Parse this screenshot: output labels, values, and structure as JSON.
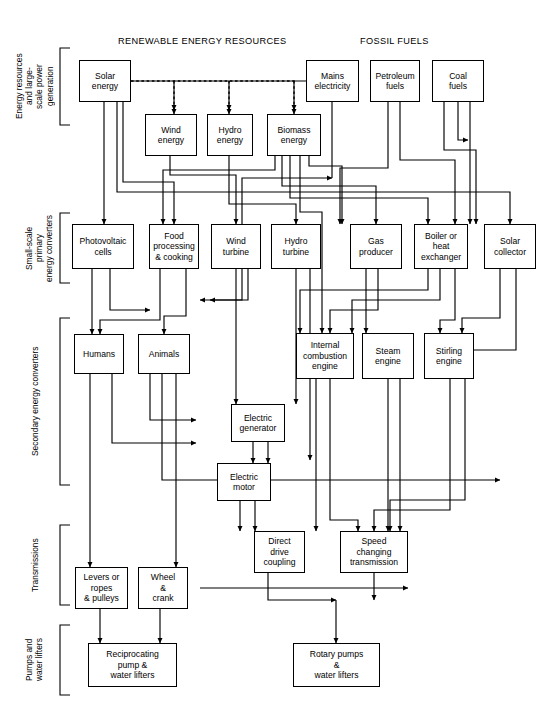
{
  "diagram": {
    "width": 555,
    "height": 725,
    "line_color": "#000000",
    "box_fill": "#ffffff"
  },
  "headers": [
    {
      "id": "renewable",
      "label": "RENEWABLE ENERGY RESOURCES",
      "x": 118,
      "y": 36
    },
    {
      "id": "fossil",
      "label": "FOSSIL FUELS",
      "x": 360,
      "y": 36
    }
  ],
  "groups": [
    {
      "id": "resources",
      "label": "Energy resources and large-\nscale power generation",
      "x": 14,
      "y": 48,
      "h": 77,
      "bx": 60
    },
    {
      "id": "small-scale",
      "label": "Small-scale primary\nenergy converters",
      "x": 24,
      "y": 213,
      "h": 70,
      "bx": 60
    },
    {
      "id": "secondary",
      "label": "Secondary energy converters",
      "x": 30,
      "y": 318,
      "h": 167,
      "bx": 60
    },
    {
      "id": "transmissions",
      "label": "Transmissions",
      "x": 30,
      "y": 525,
      "h": 80,
      "bx": 60
    },
    {
      "id": "pumps",
      "label": "Pumps and\nwater lifters",
      "x": 24,
      "y": 625,
      "h": 70,
      "bx": 60
    }
  ],
  "nodes": [
    {
      "id": "solar-energy",
      "label": "Solar\nenergy",
      "x": 79,
      "y": 60,
      "w": 52,
      "h": 42
    },
    {
      "id": "wind-energy",
      "label": "Wind\nenergy",
      "x": 145,
      "y": 114,
      "w": 52,
      "h": 42
    },
    {
      "id": "hydro-energy",
      "label": "Hydro\nenergy",
      "x": 207,
      "y": 114,
      "w": 46,
      "h": 42
    },
    {
      "id": "biomass-energy",
      "label": "Biomass\nenergy",
      "x": 267,
      "y": 114,
      "w": 54,
      "h": 42
    },
    {
      "id": "mains-electricity",
      "label": "Mains\nelectricity",
      "x": 306,
      "y": 60,
      "w": 53,
      "h": 42
    },
    {
      "id": "petroleum-fuels",
      "label": "Petroleum\nfuels",
      "x": 370,
      "y": 60,
      "w": 50,
      "h": 42
    },
    {
      "id": "coal-fuels",
      "label": "Coal\nfuels",
      "x": 432,
      "y": 60,
      "w": 52,
      "h": 42
    },
    {
      "id": "photovoltaic-cells",
      "label": "Photovoltaic\ncells",
      "x": 72,
      "y": 224,
      "w": 62,
      "h": 45
    },
    {
      "id": "food-processing",
      "label": "Food\nprocessing\n& cooking",
      "x": 149,
      "y": 224,
      "w": 50,
      "h": 45
    },
    {
      "id": "wind-turbine",
      "label": "Wind\nturbine",
      "x": 211,
      "y": 224,
      "w": 50,
      "h": 45
    },
    {
      "id": "hydro-turbine",
      "label": "Hydro\nturbine",
      "x": 271,
      "y": 224,
      "w": 50,
      "h": 45
    },
    {
      "id": "gas-producer",
      "label": "Gas\nproducer",
      "x": 350,
      "y": 224,
      "w": 52,
      "h": 45
    },
    {
      "id": "boiler-heat-exchanger",
      "label": "Boiler or\nheat\nexchanger",
      "x": 414,
      "y": 224,
      "w": 54,
      "h": 45
    },
    {
      "id": "solar-collector",
      "label": "Solar\ncollector",
      "x": 484,
      "y": 224,
      "w": 52,
      "h": 45
    },
    {
      "id": "humans",
      "label": "Humans",
      "x": 74,
      "y": 334,
      "w": 50,
      "h": 40
    },
    {
      "id": "animals",
      "label": "Animals",
      "x": 138,
      "y": 334,
      "w": 52,
      "h": 40
    },
    {
      "id": "internal-combustion-engine",
      "label": "Internal\ncombustion\nengine",
      "x": 296,
      "y": 333,
      "w": 58,
      "h": 46
    },
    {
      "id": "steam-engine",
      "label": "Steam\nengine",
      "x": 362,
      "y": 333,
      "w": 52,
      "h": 46
    },
    {
      "id": "stirling-engine",
      "label": "Stirling\nengine",
      "x": 424,
      "y": 333,
      "w": 50,
      "h": 46
    },
    {
      "id": "electric-generator",
      "label": "Electric\ngenerator",
      "x": 231,
      "y": 404,
      "w": 54,
      "h": 38
    },
    {
      "id": "electric-motor",
      "label": "Electric\nmotor",
      "x": 217,
      "y": 463,
      "w": 54,
      "h": 38
    },
    {
      "id": "direct-drive-coupling",
      "label": "Direct\ndrive\ncoupling",
      "x": 254,
      "y": 531,
      "w": 51,
      "h": 42
    },
    {
      "id": "speed-changing-transmission",
      "label": "Speed\nchanging\ntransmission",
      "x": 340,
      "y": 531,
      "w": 68,
      "h": 42
    },
    {
      "id": "levers-ropes-pulleys",
      "label": "Levers or\nropes\n& pulleys",
      "x": 75,
      "y": 567,
      "w": 53,
      "h": 42
    },
    {
      "id": "wheel-crank",
      "label": "Wheel\n&\ncrank",
      "x": 138,
      "y": 567,
      "w": 50,
      "h": 42
    },
    {
      "id": "reciprocating-pump",
      "label": "Reciprocating\npump &\nwater lifters",
      "x": 88,
      "y": 643,
      "w": 89,
      "h": 44
    },
    {
      "id": "rotary-pumps",
      "label": "Rotary pumps\n&\nwater lifters",
      "x": 293,
      "y": 643,
      "w": 87,
      "h": 44
    }
  ],
  "edge_style": {
    "solid": "solid",
    "dashed": "dashed",
    "note": "Dashed arrows leave Solar energy to Wind, Hydro and Biomass energy; all other links are solid with arrowheads."
  },
  "edges": [
    {
      "from": "solar-energy",
      "to": "wind-energy",
      "style": "dashed"
    },
    {
      "from": "solar-energy",
      "to": "hydro-energy",
      "style": "dashed"
    },
    {
      "from": "solar-energy",
      "to": "biomass-energy",
      "style": "dashed"
    },
    {
      "from": "solar-energy",
      "to": "photovoltaic-cells",
      "style": "solid"
    },
    {
      "from": "solar-energy",
      "to": "solar-collector",
      "style": "solid"
    },
    {
      "from": "solar-energy",
      "to": "food-processing",
      "style": "solid"
    },
    {
      "from": "wind-energy",
      "to": "wind-turbine",
      "style": "solid"
    },
    {
      "from": "hydro-energy",
      "to": "hydro-turbine",
      "style": "solid"
    },
    {
      "from": "biomass-energy",
      "to": "food-processing",
      "style": "solid"
    },
    {
      "from": "biomass-energy",
      "to": "gas-producer",
      "style": "solid"
    },
    {
      "from": "biomass-energy",
      "to": "boiler-heat-exchanger",
      "style": "solid"
    },
    {
      "from": "biomass-energy",
      "to": "internal-combustion-engine",
      "style": "solid"
    },
    {
      "from": "mains-electricity",
      "to": "electric-motor",
      "style": "solid"
    },
    {
      "from": "petroleum-fuels",
      "to": "boiler-heat-exchanger",
      "style": "solid"
    },
    {
      "from": "petroleum-fuels",
      "to": "internal-combustion-engine",
      "style": "solid"
    },
    {
      "from": "coal-fuels",
      "to": "gas-producer",
      "style": "solid"
    },
    {
      "from": "coal-fuels",
      "to": "boiler-heat-exchanger",
      "style": "solid"
    },
    {
      "from": "coal-fuels",
      "to": "stirling-engine",
      "style": "solid"
    },
    {
      "from": "photovoltaic-cells",
      "to": "electric-motor",
      "style": "solid"
    },
    {
      "from": "food-processing",
      "to": "humans",
      "style": "solid"
    },
    {
      "from": "food-processing",
      "to": "animals",
      "style": "solid"
    },
    {
      "from": "wind-turbine",
      "to": "electric-generator",
      "style": "solid"
    },
    {
      "from": "hydro-turbine",
      "to": "electric-generator",
      "style": "solid"
    },
    {
      "from": "gas-producer",
      "to": "internal-combustion-engine",
      "style": "solid"
    },
    {
      "from": "gas-producer",
      "to": "steam-engine",
      "style": "solid"
    },
    {
      "from": "boiler-heat-exchanger",
      "to": "steam-engine",
      "style": "solid"
    },
    {
      "from": "boiler-heat-exchanger",
      "to": "stirling-engine",
      "style": "solid"
    },
    {
      "from": "solar-collector",
      "to": "stirling-engine",
      "style": "solid"
    },
    {
      "from": "humans",
      "to": "levers-ropes-pulleys",
      "style": "solid"
    },
    {
      "from": "animals",
      "to": "wheel-crank",
      "style": "solid"
    },
    {
      "from": "electric-generator",
      "to": "electric-motor",
      "style": "solid"
    },
    {
      "from": "electric-motor",
      "to": "direct-drive-coupling",
      "style": "solid"
    },
    {
      "from": "electric-motor",
      "to": "speed-changing-transmission",
      "style": "solid"
    },
    {
      "from": "internal-combustion-engine",
      "to": "direct-drive-coupling",
      "style": "solid"
    },
    {
      "from": "steam-engine",
      "to": "speed-changing-transmission",
      "style": "solid"
    },
    {
      "from": "stirling-engine",
      "to": "speed-changing-transmission",
      "style": "solid"
    },
    {
      "from": "direct-drive-coupling",
      "to": "rotary-pumps",
      "style": "solid"
    },
    {
      "from": "speed-changing-transmission",
      "to": "rotary-pumps",
      "style": "solid"
    },
    {
      "from": "speed-changing-transmission",
      "to": "wheel-crank",
      "style": "solid"
    },
    {
      "from": "levers-ropes-pulleys",
      "to": "reciprocating-pump",
      "style": "solid"
    },
    {
      "from": "wheel-crank",
      "to": "reciprocating-pump",
      "style": "solid"
    }
  ],
  "paths": [
    "M104,102 L104,224",
    "M117,102 L117,192 L510,192 L510,224",
    "M123,102 L123,182 L174,182 L174,224",
    "M131,81 L318,81",
    "M174,81 L174,114",
    "M229,81 L229,114",
    "M294,81 L294,114",
    "M170,156 L170,175 L236,175 L236,224",
    "M229,156 L229,204 L296,204 L296,224",
    "M275,156 L275,170 L163,170 L163,224",
    "M282,156 L282,186 L376,186 L376,224",
    "M290,156 L290,198 L428,198 L428,224",
    "M300,156 L300,212 L322,212 L322,333",
    "M309,156 L309,166 L342,166 L342,224",
    "M332,102 L332,178 L332,178",
    "M332,178 L242,178 L242,300 L200,300",
    "M388,102 L388,168 L340,168 L340,224",
    "M400,102 L400,160 L455,160 L455,224",
    "M444,102 L444,150 L476,150 L476,224",
    "M458,102 L458,140 L468,140",
    "M470,102 L470,224",
    "M92,269 L92,334",
    "M110,269 L110,310 L150,310",
    "M160,269 L160,320 L100,320 L100,334",
    "M186,269 L186,316 L164,316 L164,334",
    "M236,269 L236,390 L236,404",
    "M248,269 L248,300 L210,300",
    "M296,269 L296,404",
    "M310,269 L310,460",
    "M366,269 L366,333",
    "M378,269 L378,310 L330,310 L330,333",
    "M428,269 L428,290 L300,290 L300,333",
    "M440,269 L440,300 L352,300 L352,333",
    "M455,269 L455,320 L440,320 L440,333",
    "M500,269 L500,318 L462,318 L462,333",
    "M516,269 L516,350 L470,350 L470,333",
    "M90,374 L90,567",
    "M112,374 L112,443 L196,443",
    "M150,374 L150,420 L196,420",
    "M162,374 L162,480 L270,480",
    "M176,374 L176,567",
    "M253,442 L253,463",
    "M268,442 L268,463",
    "M240,501 L240,531",
    "M255,501 L255,531",
    "M271,480 L500,480",
    "M316,379 L316,531",
    "M330,379 L330,520 L358,520 L358,531",
    "M388,379 L388,531",
    "M400,379 L400,520 L400,531",
    "M450,379 L450,510 L374,510 L374,531",
    "M465,379 L465,500 L390,500 L390,531",
    "M268,573 L268,600 L336,600",
    "M336,600 L336,643",
    "M374,573 L374,600",
    "M200,588 L408,588",
    "M100,609 L100,643",
    "M160,609 L160,643"
  ]
}
